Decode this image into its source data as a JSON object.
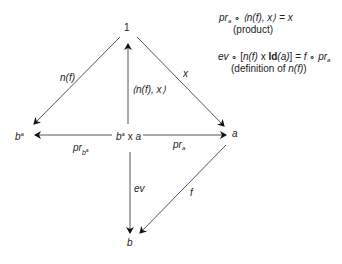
{
  "diagram": {
    "type": "commutative-diagram",
    "nodes": {
      "terminal": "1",
      "exponential_base": "b",
      "exponential_sup": "a",
      "product_base": "b",
      "product_sup": "a",
      "product_op": " x ",
      "product_right": "a",
      "object_a": "a",
      "object_b": "b"
    },
    "arrows": {
      "n_f": "n(f)",
      "x": "x",
      "pairing": "⟨n(f), x⟩",
      "pr_b_main": "pr",
      "pr_b_sub_base": "b",
      "pr_b_sub_sup": "a",
      "pr_a_main": "pr",
      "pr_a_sub": "a",
      "ev": "ev",
      "f": "f"
    },
    "equations": [
      {
        "lhs_pr": "pr",
        "lhs_sub": "a",
        "compose": " ∘ ",
        "pair": "⟨n(f), x⟩",
        "eq": " = ",
        "rhs": "x",
        "caption": "(product)"
      },
      {
        "ev": "ev",
        "compose": " ∘ ",
        "open": "[",
        "nf": "n(f)",
        "times": " x ",
        "id": "Id",
        "id_arg": "(a)",
        "close": "]",
        "eq": " = ",
        "f": "f",
        "compose2": " ∘ ",
        "pr": "pr",
        "pr_sub": "a",
        "caption_prefix": "(definition of ",
        "caption_term": "n(f)",
        "caption_suffix": ")"
      }
    ],
    "colors": {
      "line": "#555555",
      "arrowhead": "#111111",
      "text": "#222222"
    }
  }
}
